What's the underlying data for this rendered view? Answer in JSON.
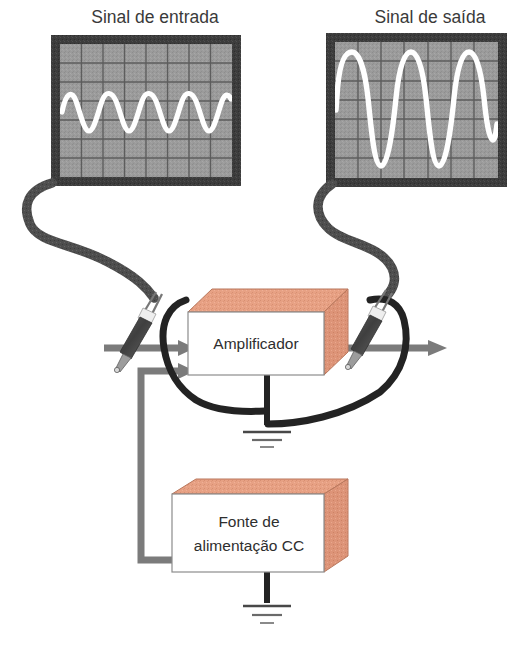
{
  "figure": {
    "kind": "amplifier-block-diagram",
    "background_color": "#ffffff"
  },
  "palette": {
    "scope_bezel": "#3b3b3b",
    "scope_screen": "#9a9a9a",
    "scope_grid_line": "#5d5d5d",
    "trace_color": "#ffffff",
    "box_face": "#ffffff",
    "box_outline": "#7a7a7a",
    "box_top_face": "#e9a184",
    "box_side_face": "#e09c80",
    "signal_arrow": "#7b7b7b",
    "probe_cable": "#4a4a4a",
    "ground_wire": "#262626",
    "probe_body": "#4d4d4d",
    "text_color": "#3a3a3a"
  },
  "captions": {
    "input_scope_title": "Sinal de entrada",
    "output_scope_title": "Sinal de saída"
  },
  "blocks": [
    {
      "id": "amplifier",
      "label": "Amplificador",
      "label_lines": [
        "Amplificador"
      ]
    },
    {
      "id": "power_supply",
      "label": "Fonte de alimentação CC",
      "label_lines": [
        "Fonte de",
        "alimentação CC"
      ]
    }
  ],
  "scopes": [
    {
      "id": "input-scope",
      "title": "Sinal de entrada",
      "grid_cols": 8,
      "grid_rows": 7,
      "waveform": {
        "shape": "sine",
        "cycles": 4,
        "amplitude_divisions": 1.0,
        "description": "pequena amplitude"
      }
    },
    {
      "id": "output-scope",
      "title": "Sinal de saída",
      "grid_cols": 7,
      "grid_rows": 7,
      "waveform": {
        "shape": "sine",
        "cycles": 4,
        "amplitude_divisions": 3.0,
        "description": "grande amplitude"
      }
    }
  ],
  "connections": [
    {
      "id": "input-signal-arrow",
      "from": "left-edge",
      "to": "amplifier",
      "style": "gray-arrow"
    },
    {
      "id": "supply-feed-arrow",
      "from": "power_supply",
      "to": "amplifier",
      "style": "gray-arrow"
    },
    {
      "id": "output-signal-arrow",
      "from": "amplifier",
      "to": "right-edge",
      "style": "gray-arrow"
    },
    {
      "id": "input-probe-cable",
      "from": "input-scope",
      "to": "amplifier-input",
      "style": "dark-cable"
    },
    {
      "id": "output-probe-cable",
      "from": "output-scope",
      "to": "amplifier-output",
      "style": "dark-cable"
    },
    {
      "id": "amplifier-ground",
      "from": "amplifier",
      "to": "ground-symbol-1",
      "style": "black-wire"
    },
    {
      "id": "power-supply-ground",
      "from": "power_supply",
      "to": "ground-symbol-2",
      "style": "black-wire"
    }
  ],
  "ground_symbols": [
    {
      "id": "amplifier-ground-symbol",
      "bars": 3
    },
    {
      "id": "power-supply-ground-symbol",
      "bars": 3
    }
  ],
  "probes": [
    {
      "id": "input-probe",
      "attached_to": "input-scope"
    },
    {
      "id": "output-probe",
      "attached_to": "output-scope"
    }
  ]
}
